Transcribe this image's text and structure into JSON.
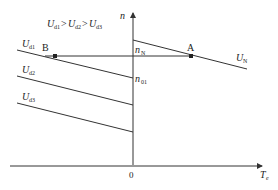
{
  "diagram": {
    "type": "motor speed-torque characteristics",
    "condition_label": {
      "U": "U",
      "s1": "d1",
      "gt1": ">",
      "s2": "d2",
      "gt2": ">",
      "s3": "d3"
    },
    "axes": {
      "y_label": "n",
      "x_label_main": "T",
      "x_label_sub": "e",
      "origin_label": "0"
    },
    "curves": [
      {
        "id": "UN",
        "label_main": "U",
        "label_sub": "N"
      },
      {
        "id": "Ud1",
        "label_main": "U",
        "label_sub": "d1"
      },
      {
        "id": "Ud2",
        "label_main": "U",
        "label_sub": "d2"
      },
      {
        "id": "Ud3",
        "label_main": "U",
        "label_sub": "d3"
      }
    ],
    "points": [
      {
        "id": "A",
        "label": "A"
      },
      {
        "id": "B",
        "label": "B"
      }
    ],
    "speed_labels": [
      {
        "id": "nN",
        "main": "n",
        "sub": "N"
      },
      {
        "id": "n01",
        "main": "n",
        "sub": "01"
      }
    ],
    "colors": {
      "ink": "#333333",
      "background": "#ffffff"
    }
  }
}
